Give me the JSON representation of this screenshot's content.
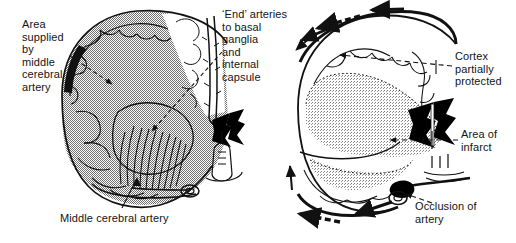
{
  "figure": {
    "panels": [
      {
        "id": "left-panel",
        "name": "coronal-section-arterial-supply",
        "description": "Coronal brain section, left hemisphere, shaded to show the area supplied by the middle cerebral artery with end arteries to basal ganglia and internal capsule"
      },
      {
        "id": "right-panel",
        "name": "coronal-section-infarct",
        "description": "Coronal brain section with occluded middle cerebral artery, collateral flow arrows around cortical surface and stippled area of infarct"
      }
    ]
  },
  "labels": {
    "area_supplied": "Area\nsupplied\nby\nmiddle\ncerebral\nartery",
    "end_arteries": "‘End’ arteries\nto basal\nganglia\nand\ninternal\ncapsule",
    "middle_cerebral_artery": "Middle cerebral artery",
    "cortex_partially_protected": "Cortex\npartially\nprotected",
    "area_of_infarct": "Area of\ninfarct",
    "occlusion_of_artery": "Occlusion of\nartery"
  },
  "colors": {
    "ink": "#111111",
    "background": "#ffffff",
    "territory_shading": "#8e8e8e",
    "infarct_shading": "#b3b3b3",
    "solid_black": "#000000"
  },
  "icons": {
    "leader_dashed": "dashed-leader-line",
    "arrowhead": "solid-arrowhead",
    "flow_arrow": "collateral-flow-arrow",
    "occlusion_marker": "occluded-artery-blob"
  }
}
